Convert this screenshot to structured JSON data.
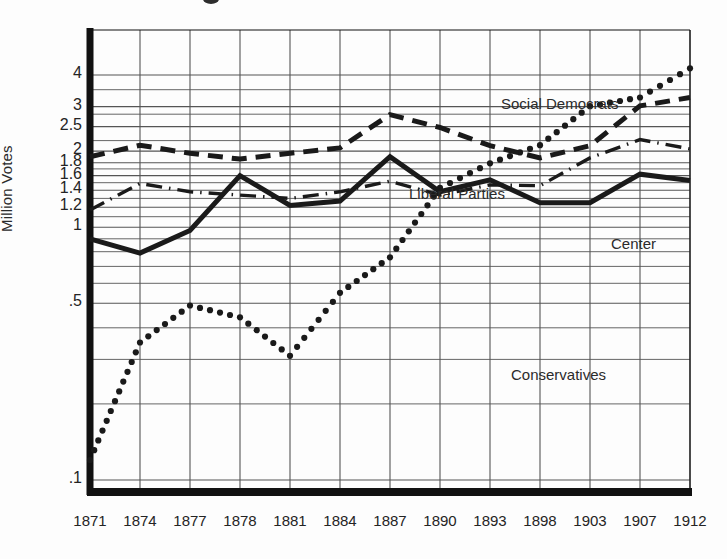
{
  "chart_data": {
    "type": "line",
    "title": "",
    "subtitle": "",
    "xlabel": "",
    "ylabel": "Million Votes",
    "y_scale": "log",
    "grid": true,
    "legend_position": "inline-annotations",
    "categories": [
      "1871",
      "1874",
      "1877",
      "1878",
      "1881",
      "1884",
      "1887",
      "1890",
      "1893",
      "1898",
      "1903",
      "1907",
      "1912"
    ],
    "x": [
      1871,
      1874,
      1877,
      1878,
      1881,
      1884,
      1887,
      1890,
      1893,
      1898,
      1903,
      1907,
      1912
    ],
    "ylim": [
      0.1,
      4.6
    ],
    "y_ticks": [
      {
        "label": "4",
        "value": 4
      },
      {
        "label": "3",
        "value": 3
      },
      {
        "label": "2.5",
        "value": 2.5
      },
      {
        "label": "2",
        "value": 2
      },
      {
        "label": "1.8",
        "value": 1.8
      },
      {
        "label": "1.6",
        "value": 1.6
      },
      {
        "label": "1.4",
        "value": 1.4
      },
      {
        "label": "1.2",
        "value": 1.2
      },
      {
        "label": "1",
        "value": 1
      },
      {
        "label": ".5",
        "value": 0.5
      },
      {
        "label": ".1",
        "value": 0.1
      }
    ],
    "series": [
      {
        "name": "Social Democrats",
        "style": "dotted",
        "values": [
          0.12,
          0.35,
          0.49,
          0.44,
          0.31,
          0.55,
          0.76,
          1.43,
          1.79,
          2.11,
          3.01,
          3.26,
          4.25
        ]
      },
      {
        "name": "Liberal Parties",
        "style": "dashed",
        "values": [
          1.9,
          2.11,
          1.96,
          1.86,
          1.96,
          2.06,
          2.79,
          2.48,
          2.1,
          1.88,
          2.1,
          3.02,
          3.26
        ]
      },
      {
        "name": "Center",
        "style": "dash-dot",
        "values": [
          1.17,
          1.49,
          1.38,
          1.34,
          1.3,
          1.38,
          1.52,
          1.34,
          1.47,
          1.46,
          1.88,
          2.22,
          2.04
        ]
      },
      {
        "name": "Conservatives",
        "style": "solid",
        "values": [
          0.9,
          0.79,
          0.97,
          1.6,
          1.22,
          1.27,
          1.9,
          1.38,
          1.54,
          1.25,
          1.25,
          1.62,
          1.53
        ]
      }
    ],
    "annotations": [
      {
        "text": "Social Democrats",
        "series": "Social Democrats"
      },
      {
        "text": "Liberal Parties",
        "series": "Liberal Parties"
      },
      {
        "text": "Center",
        "series": "Center"
      },
      {
        "text": "Conservatives",
        "series": "Conservatives"
      }
    ],
    "colors": {
      "ink": "#1a1a1a",
      "grid": "#555555",
      "axis": "#111111",
      "background": "#fdfdfd"
    }
  }
}
